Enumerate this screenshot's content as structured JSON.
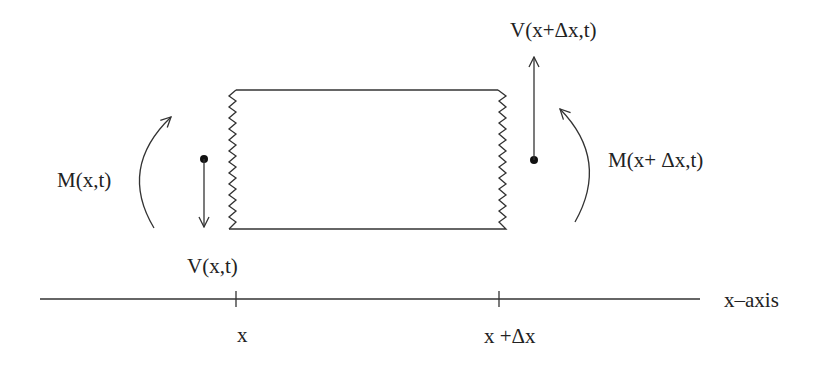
{
  "diagram": {
    "labels": {
      "shear_right": "V(x+Δx,t)",
      "moment_left": "M(x,t)",
      "moment_right": "M(x+ Δx,t)",
      "shear_left": "V(x,t)",
      "axis_tick_left": "x",
      "axis_tick_right": "x +Δx",
      "axis_name": "x–axis"
    },
    "elements": {
      "beam_segment": {
        "left_x": 232,
        "right_x": 502,
        "top_y": 90,
        "bottom_y": 229,
        "cut_edges": "zigzag"
      },
      "shear_left_arrow": {
        "direction": "down",
        "origin": [
          204,
          159
        ]
      },
      "shear_right_arrow": {
        "direction": "up",
        "origin": [
          534,
          160
        ]
      },
      "moment_left_arc": {
        "direction": "counterclockwise-up"
      },
      "moment_right_arc": {
        "direction": "clockwise-up"
      },
      "x_axis": {
        "y": 299,
        "from_x": 40,
        "to_x": 700,
        "ticks": [
          236,
          499
        ]
      }
    },
    "colors": {
      "stroke": "#333333",
      "text": "#222222",
      "background": "#ffffff"
    }
  }
}
